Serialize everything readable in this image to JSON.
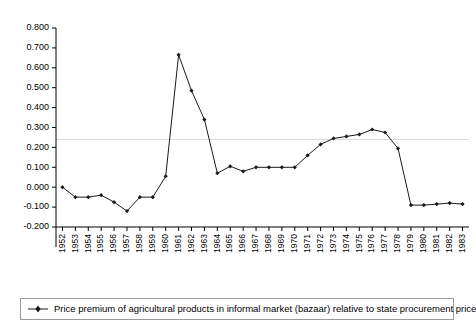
{
  "chart_data": {
    "type": "line",
    "title": "",
    "xlabel": "",
    "ylabel": "",
    "ylim": [
      -0.2,
      0.8
    ],
    "ytick_step": 0.1,
    "ytick_labels": [
      "0.800",
      "0.700",
      "0.600",
      "0.500",
      "0.400",
      "0.300",
      "0.200",
      "0.100",
      "0.000",
      "-0.100",
      "-0.200"
    ],
    "ytick_values": [
      0.8,
      0.7,
      0.6,
      0.5,
      0.4,
      0.3,
      0.2,
      0.1,
      0.0,
      -0.1,
      -0.2
    ],
    "grid": "single horizontal reference line at 0.240",
    "reference_line": 0.24,
    "legend_position": "bottom",
    "categories": [
      "1952",
      "1953",
      "1954",
      "1955",
      "1956",
      "1957",
      "1958",
      "1959",
      "1960",
      "1961",
      "1962",
      "1963",
      "1964",
      "1965",
      "1966",
      "1967",
      "1968",
      "1969",
      "1970",
      "1971",
      "1972",
      "1973",
      "1974",
      "1975",
      "1976",
      "1977",
      "1978",
      "1979",
      "1980",
      "1981",
      "1982",
      "1983"
    ],
    "series": [
      {
        "name": "Price premium of agricultural products in informal market (bazaar) relative to state procurement price",
        "marker": "diamond",
        "color": "#1a1a1a",
        "values": [
          0.0,
          -0.05,
          -0.05,
          -0.04,
          -0.075,
          -0.12,
          -0.05,
          -0.05,
          0.055,
          0.665,
          0.485,
          0.34,
          0.07,
          0.105,
          0.08,
          0.1,
          0.1,
          0.1,
          0.1,
          0.16,
          0.215,
          0.245,
          0.255,
          0.265,
          0.29,
          0.275,
          0.195,
          -0.09,
          -0.09,
          -0.085,
          -0.08,
          -0.085
        ]
      }
    ]
  },
  "legend": {
    "entries": [
      {
        "label": "Price premium of agricultural products in informal market (bazaar) relative to state procurement price"
      }
    ]
  }
}
